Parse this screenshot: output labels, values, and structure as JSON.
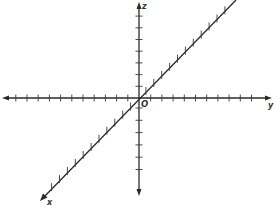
{
  "diagram": {
    "title": "",
    "type": "3d-coordinate-axes",
    "colors": {
      "axis": "#2a2a2a",
      "tick": "#3a3a3a",
      "label": "#333333",
      "background": "#ffffff"
    },
    "origin": {
      "label": "O",
      "px": [
        139,
        98
      ]
    },
    "axes": [
      {
        "name": "y",
        "label": "y",
        "direction": "horizontal",
        "ticks_left": 11,
        "ticks_right": 10,
        "tick_spacing_px": 11.2
      },
      {
        "name": "z",
        "label": "z",
        "direction": "vertical",
        "ticks_up": 7,
        "ticks_down": 6,
        "tick_spacing_px": 12
      },
      {
        "name": "x",
        "label": "x",
        "direction": "diagonal",
        "ticks_lower_left": 11,
        "ticks_upper_right": 11,
        "tick_spacing_px": 11.2
      }
    ]
  }
}
